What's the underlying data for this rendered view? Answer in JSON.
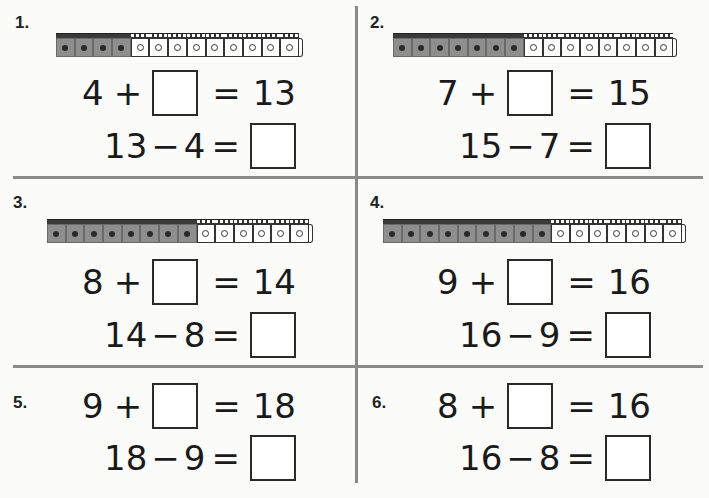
{
  "colors": {
    "rule": "#8a8a8a",
    "cube_gray": "#8e8e8e",
    "cube_white": "#ffffff",
    "ink": "#1a1a1a"
  },
  "problems": [
    {
      "label": "1.",
      "cubes": {
        "gray": 4,
        "white": 9
      },
      "addition": {
        "a": "4",
        "op": "+",
        "eq": "=",
        "sum": "13"
      },
      "subtraction": {
        "total": "13",
        "op": "−",
        "b": "4",
        "eq": "="
      }
    },
    {
      "label": "2.",
      "cubes": {
        "gray": 7,
        "white": 8
      },
      "addition": {
        "a": "7",
        "op": "+",
        "eq": "=",
        "sum": "15"
      },
      "subtraction": {
        "total": "15",
        "op": "−",
        "b": "7",
        "eq": "="
      }
    },
    {
      "label": "3.",
      "cubes": {
        "gray": 8,
        "white": 6
      },
      "addition": {
        "a": "8",
        "op": "+",
        "eq": "=",
        "sum": "14"
      },
      "subtraction": {
        "total": "14",
        "op": "−",
        "b": "8",
        "eq": "="
      }
    },
    {
      "label": "4.",
      "cubes": {
        "gray": 9,
        "white": 7
      },
      "addition": {
        "a": "9",
        "op": "+",
        "eq": "=",
        "sum": "16"
      },
      "subtraction": {
        "total": "16",
        "op": "−",
        "b": "9",
        "eq": "="
      }
    },
    {
      "label": "5.",
      "cubes": null,
      "addition": {
        "a": "9",
        "op": "+",
        "eq": "=",
        "sum": "18"
      },
      "subtraction": {
        "total": "18",
        "op": "−",
        "b": "9",
        "eq": "="
      }
    },
    {
      "label": "6.",
      "cubes": null,
      "addition": {
        "a": "8",
        "op": "+",
        "eq": "=",
        "sum": "16"
      },
      "subtraction": {
        "total": "16",
        "op": "−",
        "b": "8",
        "eq": "="
      }
    }
  ]
}
